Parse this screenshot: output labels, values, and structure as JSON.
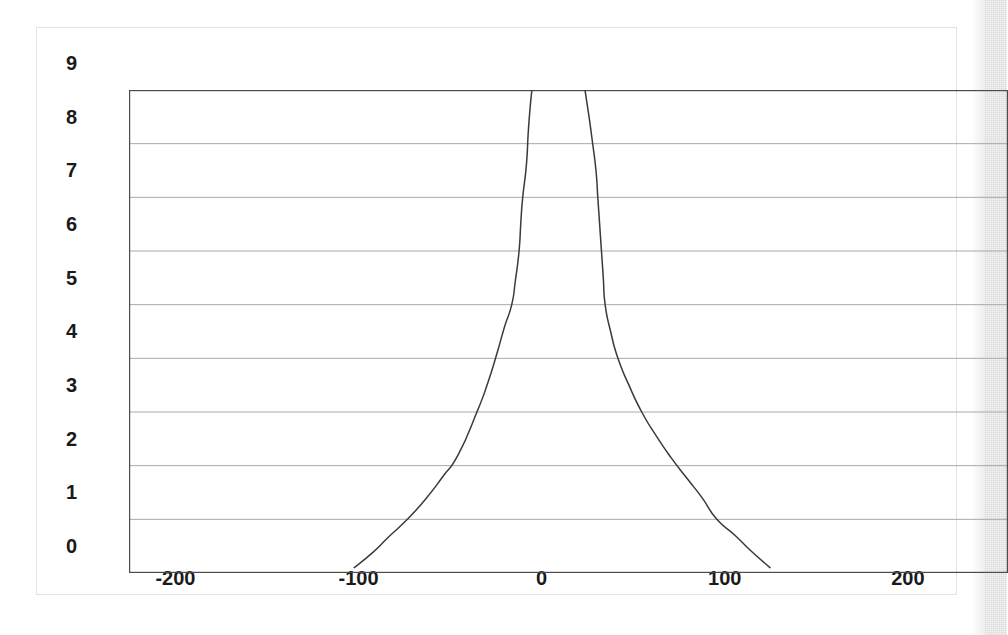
{
  "chart_data": {
    "type": "line",
    "title": "",
    "subtitle": "",
    "xlabel": "",
    "ylabel": "",
    "xlim": [
      -245,
      235
    ],
    "ylim": [
      0,
      9
    ],
    "grid": "horizontal",
    "legend": "none",
    "annotations": [],
    "x_ticks": [
      {
        "label": "-200",
        "value": -200
      },
      {
        "label": "-100",
        "value": -100
      },
      {
        "label": "0",
        "value": 0
      },
      {
        "label": "100",
        "value": 100
      },
      {
        "label": "200",
        "value": 200
      }
    ],
    "y_ticks": [
      {
        "label": "0",
        "value": 0
      },
      {
        "label": "1",
        "value": 1
      },
      {
        "label": "2",
        "value": 2
      },
      {
        "label": "3",
        "value": 3
      },
      {
        "label": "4",
        "value": 4
      },
      {
        "label": "5",
        "value": 5
      },
      {
        "label": "6",
        "value": 6
      },
      {
        "label": "7",
        "value": 7
      },
      {
        "label": "8",
        "value": 8
      },
      {
        "label": "9",
        "value": 9
      }
    ],
    "series": [
      {
        "name": "left-branch",
        "color": "#3a3a3a",
        "points": [
          [
            -122,
            0.1
          ],
          [
            -112,
            0.38
          ],
          [
            -103,
            0.68
          ],
          [
            -93,
            1.0
          ],
          [
            -83,
            1.38
          ],
          [
            -74,
            1.78
          ],
          [
            -65,
            2.22
          ],
          [
            -55,
            3.0
          ],
          [
            -49,
            3.55
          ],
          [
            -44,
            4.1
          ],
          [
            -40,
            4.58
          ],
          [
            -36,
            5.0
          ],
          [
            -34,
            5.45
          ],
          [
            -32,
            6.0
          ],
          [
            -31,
            6.55
          ],
          [
            -30,
            7.0
          ],
          [
            -28,
            7.6
          ],
          [
            -27,
            8.2
          ],
          [
            -26,
            8.65
          ],
          [
            -25,
            9.0
          ]
        ]
      },
      {
        "name": "right-branch",
        "color": "#3a3a3a",
        "points": [
          [
            4,
            9.0
          ],
          [
            6,
            8.55
          ],
          [
            8,
            8.05
          ],
          [
            10,
            7.5
          ],
          [
            11,
            7.0
          ],
          [
            12,
            6.5
          ],
          [
            13,
            6.0
          ],
          [
            14,
            5.5
          ],
          [
            15,
            5.0
          ],
          [
            18,
            4.5
          ],
          [
            22,
            4.0
          ],
          [
            28,
            3.5
          ],
          [
            35,
            3.0
          ],
          [
            43,
            2.55
          ],
          [
            51,
            2.15
          ],
          [
            60,
            1.75
          ],
          [
            68,
            1.4
          ],
          [
            76,
            1.0
          ],
          [
            86,
            0.7
          ],
          [
            95,
            0.4
          ],
          [
            105,
            0.1
          ]
        ]
      }
    ]
  },
  "axes": {
    "plot_border_color": "#4a4a4a",
    "gridline_color": "#a9a9a9",
    "frame_color": "#e2e2e2"
  }
}
